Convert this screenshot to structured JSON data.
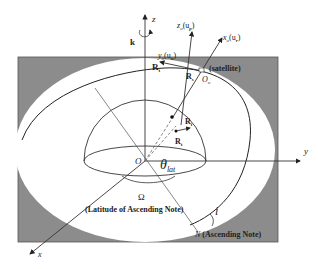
{
  "diagram": {
    "axes": {
      "z": "z",
      "y": "y",
      "x": "x",
      "k": "k",
      "origin": "O"
    },
    "satellite_frame": {
      "z_label": "z",
      "z_sub": "o",
      "z_vec": "(u",
      "z_vec_sub": "p",
      "y_label": "y",
      "y_sub": "o",
      "y_vec": "(u",
      "y_vec_sub": "n",
      "x_label": "x",
      "x_sub": "o",
      "x_vec": "(u",
      "x_vec_sub": "r",
      "close": ")",
      "origin": "O",
      "origin_sub": "o",
      "satellite": "(satellite)"
    },
    "vectors": {
      "Rt_a": "R",
      "Rt_a_sub": "t",
      "Rs": "R",
      "Rs_sub": "s",
      "Rt_b": "R",
      "Rt_b_sub": "t",
      "Ri": "R",
      "Ri_sub": "i"
    },
    "angles": {
      "theta": "θ",
      "theta_sub": "lat",
      "omega": "Ω",
      "omega_desc": "(Latitude of Ascending Note)",
      "inclination": "i"
    },
    "node": {
      "label": "N",
      "desc": "(Ascending Note)"
    },
    "colors": {
      "plane_fill": "#8c8c8c",
      "line": "#222222",
      "ellipse_fill": "#ffffff"
    }
  }
}
